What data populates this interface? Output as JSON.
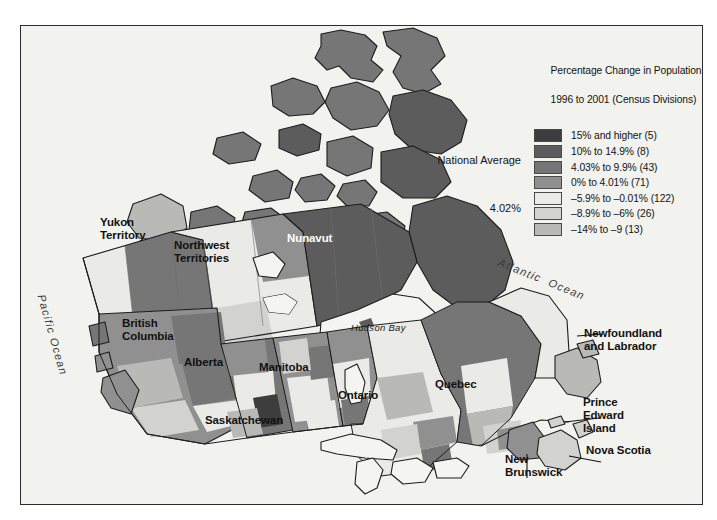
{
  "legend": {
    "title_line1": "Percentage Change in Population",
    "title_line2": "1996 to 2001 (Census Divisions)",
    "entries": [
      {
        "label": "15% and higher (5)",
        "color": "#3d3d3d",
        "range": "15% and higher",
        "count": 5
      },
      {
        "label": "10% to 14.9% (8)",
        "color": "#5c5c5c",
        "range": "10% to 14.9%",
        "count": 8
      },
      {
        "label": "4.03% to 9.9% (43)",
        "color": "#767676",
        "range": "4.03% to 9.9%",
        "count": 43
      },
      {
        "label": "0% to 4.01% (71)",
        "color": "#909090",
        "range": "0% to 4.01%",
        "count": 71
      },
      {
        "label": "–5.9% to –0.01% (122)",
        "color": "#eaeae6",
        "range": "-5.9% to -0.01%",
        "count": 122
      },
      {
        "label": "–8.9% to –6% (26)",
        "color": "#d2d2cf",
        "range": "-8.9% to -6%",
        "count": 26
      },
      {
        "label": "–14% to –9 (13)",
        "color": "#b9b9b6",
        "range": "-14% to -9",
        "count": 13
      }
    ]
  },
  "national_average": {
    "label": "National Average",
    "value": "4.02%"
  },
  "provinces": [
    {
      "name": "Yukon\nTerritory",
      "key": "yukon"
    },
    {
      "name": "Northwest\nTerritories",
      "key": "northwest-territories"
    },
    {
      "name": "Nunavut",
      "key": "nunavut"
    },
    {
      "name": "British\nColumbia",
      "key": "british-columbia"
    },
    {
      "name": "Alberta",
      "key": "alberta"
    },
    {
      "name": "Saskatchewan",
      "key": "saskatchewan"
    },
    {
      "name": "Manitoba",
      "key": "manitoba"
    },
    {
      "name": "Ontario",
      "key": "ontario"
    },
    {
      "name": "Quebec",
      "key": "quebec"
    },
    {
      "name": "Newfoundland\nand Labrador",
      "key": "newfoundland-and-labrador"
    },
    {
      "name": "Prince\nEdward\nIsland",
      "key": "prince-edward-island"
    },
    {
      "name": "Nova Scotia",
      "key": "nova-scotia"
    },
    {
      "name": "New\nBrunswick",
      "key": "new-brunswick"
    }
  ],
  "water_labels": [
    {
      "name": "Pacific Ocean",
      "key": "pacific-ocean"
    },
    {
      "name": "Atlantic  Ocean",
      "key": "atlantic-ocean"
    },
    {
      "name": "Hudson Bay",
      "key": "hudson-bay"
    }
  ],
  "colors": {
    "background": "#f2f2ef",
    "frame_border": "#2b2b2b",
    "water": "#f4f4f1",
    "coastline": "#1d1d1d",
    "division_line": "#6e6e6e"
  }
}
